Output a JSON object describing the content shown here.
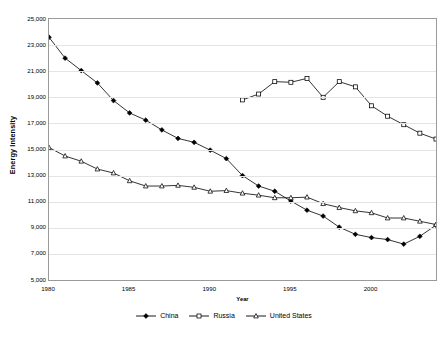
{
  "chart_data": {
    "type": "line",
    "title": "",
    "xlabel": "Year",
    "ylabel": "Energy Intensity",
    "xlim": [
      1980,
      2004
    ],
    "ylim": [
      5000,
      25000
    ],
    "grid": true,
    "legend_position": "bottom",
    "x": [
      1980,
      1981,
      1982,
      1983,
      1984,
      1985,
      1986,
      1987,
      1988,
      1989,
      1990,
      1991,
      1992,
      1993,
      1994,
      1995,
      1996,
      1997,
      1998,
      1999,
      2000,
      2001,
      2002,
      2003,
      2004
    ],
    "x_tick_labels": [
      "1980",
      "1985",
      "1990",
      "1995",
      "2000"
    ],
    "x_tick_values": [
      1980,
      1985,
      1990,
      1995,
      2000
    ],
    "y_tick_labels": [
      "25,000",
      "23,000",
      "21,000",
      "19,000",
      "17,000",
      "15,000",
      "13,000",
      "11,000",
      "9,000",
      "7,000",
      "5,000"
    ],
    "y_tick_values": [
      25000,
      23000,
      21000,
      19000,
      17000,
      15000,
      13000,
      11000,
      9000,
      7000,
      5000
    ],
    "series": [
      {
        "name": "China",
        "marker": "filled-diamond",
        "color": "#000000",
        "x": [
          1980,
          1981,
          1982,
          1983,
          1984,
          1985,
          1986,
          1987,
          1988,
          1989,
          1990,
          1991,
          1992,
          1993,
          1994,
          1995,
          1996,
          1997,
          1998,
          1999,
          2000,
          2001,
          2002,
          2003,
          2004
        ],
        "values": [
          23600,
          22000,
          21050,
          20100,
          18750,
          17800,
          17250,
          16500,
          15850,
          15550,
          14950,
          14300,
          13000,
          12200,
          11800,
          11050,
          10350,
          9900,
          9050,
          8500,
          8250,
          8100,
          7750,
          8350,
          9200
        ]
      },
      {
        "name": "Russia",
        "marker": "open-square",
        "color": "#000000",
        "x": [
          1992,
          1993,
          1994,
          1995,
          1996,
          1997,
          1998,
          1999,
          2000,
          2001,
          2002,
          2003,
          2004
        ],
        "values": [
          18800,
          19250,
          20200,
          20150,
          20450,
          19000,
          20200,
          19800,
          18350,
          17550,
          16900,
          16250,
          15800
        ]
      },
      {
        "name": "United States",
        "marker": "open-triangle",
        "color": "#000000",
        "x": [
          1980,
          1981,
          1982,
          1983,
          1984,
          1985,
          1986,
          1987,
          1988,
          1989,
          1990,
          1991,
          1992,
          1993,
          1994,
          1995,
          1996,
          1997,
          1998,
          1999,
          2000,
          2001,
          2002,
          2003,
          2004
        ],
        "values": [
          15150,
          14500,
          14100,
          13500,
          13200,
          12600,
          12200,
          12200,
          12250,
          12100,
          11800,
          11850,
          11650,
          11500,
          11300,
          11300,
          11350,
          10850,
          10550,
          10300,
          10150,
          9750,
          9750,
          9500,
          9250
        ]
      }
    ]
  },
  "legend": {
    "items": [
      {
        "label": "China"
      },
      {
        "label": "Russia"
      },
      {
        "label": "United States"
      }
    ]
  },
  "axes": {
    "y_title": "Energy Intensity",
    "x_title": "Year"
  }
}
